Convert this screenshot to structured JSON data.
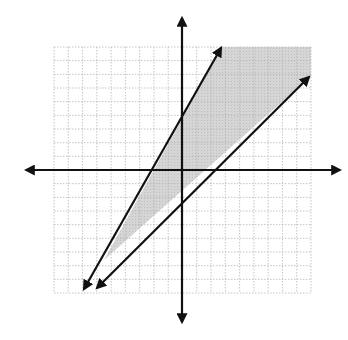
{
  "chart_data": {
    "type": "line",
    "title": "",
    "xlabel": "",
    "ylabel": "",
    "xlim": [
      -9,
      9
    ],
    "ylim": [
      -9,
      9
    ],
    "grid": true,
    "grid_style": "dotted",
    "shaded_region": {
      "description": "Region between the two lines: below the steep line and above the shallow line, extending to the upper-right of the grid",
      "color": "#cfcfcf"
    },
    "series": [
      {
        "name": "steep-line",
        "style": "solid with arrows at both ends",
        "slope": 1.75,
        "y_intercept": 3,
        "points": [
          {
            "x": -6.8,
            "y": -8.5
          },
          {
            "x": 2.8,
            "y": 8.8
          }
        ]
      },
      {
        "name": "shallow-line",
        "style": "solid with arrows at both ends",
        "slope": 0.8,
        "y_intercept": -1.6,
        "points": [
          {
            "x": -6.0,
            "y": -8.5
          },
          {
            "x": 9.0,
            "y": 6.6
          }
        ]
      }
    ],
    "intersection": {
      "x": -5.3,
      "y": -6.3
    }
  },
  "colors": {
    "axis": "#111111",
    "line": "#111111",
    "grid": "#b8b8b8",
    "shade": "#d0d0d0",
    "background": "#ffffff"
  }
}
